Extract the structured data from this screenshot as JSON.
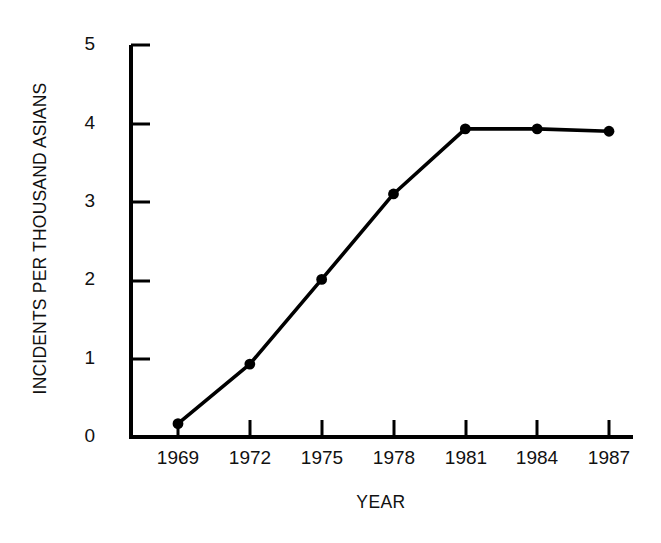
{
  "chart_data": {
    "type": "line",
    "title": "",
    "xlabel": "YEAR",
    "ylabel": "INCIDENTS PER THOUSAND ASIANS",
    "categories": [
      "1969",
      "1972",
      "1975",
      "1978",
      "1981",
      "1984",
      "1987"
    ],
    "x": [
      1969,
      1972,
      1975,
      1978,
      1981,
      1984,
      1987
    ],
    "values": [
      0.17,
      0.93,
      2.01,
      3.1,
      3.93,
      3.93,
      3.9
    ],
    "series": [
      {
        "name": "Incidents per thousand Asians",
        "values": [
          0.17,
          0.93,
          2.01,
          3.1,
          3.93,
          3.93,
          3.9
        ]
      }
    ],
    "xlim": [
      1968,
      1988
    ],
    "ylim": [
      0,
      5
    ],
    "ytick_labels": [
      "0",
      "1",
      "2",
      "3",
      "4",
      "5"
    ],
    "ytick_values": [
      0,
      1,
      2,
      3,
      4,
      5
    ],
    "xtick_labels": [
      "1969",
      "1972",
      "1975",
      "1978",
      "1981",
      "1984",
      "1987"
    ],
    "grid": false,
    "legend": false,
    "legend_position": "none",
    "marker": "filled-circle",
    "line_color": "#000000",
    "marker_color": "#000000",
    "background_color": "#ffffff",
    "axis_color": "#000000"
  },
  "axis": {
    "y_title": "INCIDENTS PER THOUSAND ASIANS",
    "x_title": "YEAR",
    "y_ticks": [
      {
        "label": "5"
      },
      {
        "label": "4"
      },
      {
        "label": "3"
      },
      {
        "label": "2"
      },
      {
        "label": "1"
      },
      {
        "label": "0"
      }
    ],
    "x_ticks": [
      {
        "label": "1969"
      },
      {
        "label": "1972"
      },
      {
        "label": "1975"
      },
      {
        "label": "1978"
      },
      {
        "label": "1981"
      },
      {
        "label": "1984"
      },
      {
        "label": "1987"
      }
    ]
  }
}
